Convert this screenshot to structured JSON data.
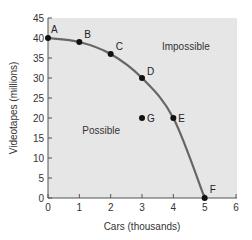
{
  "chart_data": {
    "type": "line",
    "title": "",
    "xlabel": "Cars (thousands)",
    "ylabel": "Videotapes (millions)",
    "xlim": [
      0,
      6
    ],
    "ylim": [
      0,
      45
    ],
    "x_ticks": [
      "0",
      "1",
      "2",
      "3",
      "4",
      "5",
      "6"
    ],
    "y_ticks": [
      "0",
      "5",
      "10",
      "15",
      "20",
      "25",
      "30",
      "35",
      "40",
      "45"
    ],
    "grid": false,
    "legend": null,
    "background_color": "#e6e6e6",
    "curve_color": "#666666",
    "series": [
      {
        "name": "Production possibilities frontier",
        "points": [
          {
            "label": "A",
            "x": 0,
            "y": 40
          },
          {
            "label": "B",
            "x": 1,
            "y": 39
          },
          {
            "label": "C",
            "x": 2,
            "y": 36
          },
          {
            "label": "D",
            "x": 3,
            "y": 30
          },
          {
            "label": "E",
            "x": 4,
            "y": 20
          },
          {
            "label": "F",
            "x": 5,
            "y": 0
          }
        ]
      }
    ],
    "extra_points": [
      {
        "label": "G",
        "x": 3,
        "y": 20
      }
    ],
    "annotations": [
      {
        "text": "Impossible",
        "x": 4.4,
        "y": 37
      },
      {
        "text": "Possible",
        "x": 1.7,
        "y": 16
      }
    ]
  }
}
